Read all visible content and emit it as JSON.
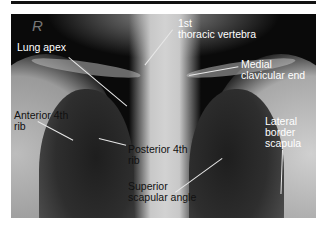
{
  "figure": {
    "type": "Chest X-ray (PA view) with anatomical annotations",
    "side_marker": "R",
    "labels": [
      {
        "id": "lung-apex",
        "text": "Lung apex"
      },
      {
        "id": "first-thoracic-vertebra",
        "text": "1st\nthoracic vertebra"
      },
      {
        "id": "medial-clavicular-end",
        "text": "Medial\nclavicular end"
      },
      {
        "id": "anterior-4th-rib",
        "text": "Anterior 4th\nrib"
      },
      {
        "id": "posterior-4th-rib",
        "text": "Posterior 4th\nrib"
      },
      {
        "id": "lateral-border-scapula",
        "text": "Lateral\nborder\nscapula"
      },
      {
        "id": "superior-scapular-angle",
        "text": "Superior\nscapular angle"
      }
    ]
  }
}
